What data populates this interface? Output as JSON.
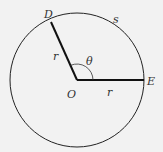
{
  "diagram": {
    "type": "circle-sector",
    "labels": {
      "point_d": "D",
      "point_e": "E",
      "center": "O",
      "radius_1": "r",
      "radius_2": "r",
      "angle": "θ",
      "arc": "s"
    },
    "colors": {
      "background": "#f2f2f2",
      "stroke": "#222222",
      "text": "#333333"
    }
  }
}
